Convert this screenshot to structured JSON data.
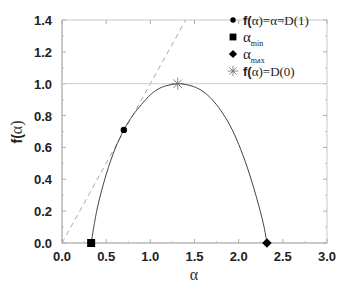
{
  "chart_data": {
    "type": "line",
    "title": "",
    "xlabel": "α",
    "ylabel": "f(α)",
    "xlim": [
      0.0,
      3.0
    ],
    "ylim": [
      0.0,
      1.4
    ],
    "xticks": [
      "0.0",
      "0.5",
      "1.0",
      "1.5",
      "2.0",
      "2.5",
      "3.0"
    ],
    "yticks": [
      "0.0",
      "0.2",
      "0.4",
      "0.6",
      "0.8",
      "1.0",
      "1.2",
      "1.4"
    ],
    "grid": false,
    "reference_lines": [
      {
        "name": "f(α)=α",
        "style": "dashed",
        "color": "#aaaaaa",
        "x": [
          0.0,
          1.4
        ],
        "y": [
          0.0,
          1.4
        ]
      },
      {
        "name": "f(α)=1",
        "style": "solid",
        "color": "#cccccc",
        "x": [
          0.0,
          3.0
        ],
        "y": [
          1.0,
          1.0
        ]
      }
    ],
    "series": [
      {
        "name": "f(α) spectrum",
        "style": "solid",
        "color": "#444444",
        "x": [
          0.33,
          0.4,
          0.5,
          0.6,
          0.7,
          0.8,
          0.9,
          1.0,
          1.1,
          1.2,
          1.31,
          1.4,
          1.5,
          1.6,
          1.7,
          1.8,
          1.9,
          2.0,
          2.1,
          2.2,
          2.28,
          2.32
        ],
        "y": [
          0.0,
          0.22,
          0.43,
          0.59,
          0.71,
          0.8,
          0.87,
          0.93,
          0.97,
          0.99,
          1.0,
          0.995,
          0.98,
          0.95,
          0.9,
          0.83,
          0.74,
          0.62,
          0.47,
          0.29,
          0.12,
          0.0
        ]
      }
    ],
    "markers": [
      {
        "name": "f(α)=α=D(1)",
        "shape": "circle",
        "x": 0.7,
        "y": 0.71
      },
      {
        "name": "α_min",
        "shape": "square",
        "x": 0.33,
        "y": 0.0
      },
      {
        "name": "α_max",
        "shape": "diamond",
        "x": 2.32,
        "y": 0.0
      },
      {
        "name": "f(α)=D(0)",
        "shape": "star",
        "x": 1.31,
        "y": 1.0
      }
    ],
    "legend": {
      "position": "upper right",
      "entries": [
        {
          "symbol": "circle",
          "bold_prefix": "f(",
          "text": "α)=α=D(1)"
        },
        {
          "symbol": "square",
          "text": "α",
          "subscript": "min"
        },
        {
          "symbol": "diamond",
          "text": "α",
          "subscript": "max"
        },
        {
          "symbol": "star",
          "bold_prefix": "f(",
          "text": "α)=D(0)"
        }
      ]
    }
  }
}
